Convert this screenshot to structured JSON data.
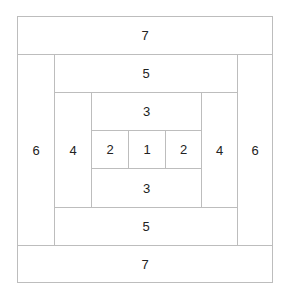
{
  "diagram": {
    "line_color": "#bdbdbd",
    "text_color": "#222222",
    "pieces": [
      {
        "id": "top-7",
        "label": "7",
        "x": 17,
        "y": 16,
        "w": 256,
        "h": 39
      },
      {
        "id": "left-6",
        "label": "6",
        "x": 17,
        "y": 54,
        "w": 38,
        "h": 192
      },
      {
        "id": "right-6",
        "label": "6",
        "x": 237,
        "y": 54,
        "w": 36,
        "h": 192
      },
      {
        "id": "bottom-7",
        "label": "7",
        "x": 17,
        "y": 245,
        "w": 256,
        "h": 38
      },
      {
        "id": "top-5",
        "label": "5",
        "x": 54,
        "y": 54,
        "w": 184,
        "h": 39
      },
      {
        "id": "bottom-5",
        "label": "5",
        "x": 54,
        "y": 207,
        "w": 184,
        "h": 39
      },
      {
        "id": "left-4",
        "label": "4",
        "x": 54,
        "y": 92,
        "w": 38,
        "h": 116
      },
      {
        "id": "right-4",
        "label": "4",
        "x": 201,
        "y": 92,
        "w": 37,
        "h": 116
      },
      {
        "id": "top-3",
        "label": "3",
        "x": 91,
        "y": 92,
        "w": 111,
        "h": 39
      },
      {
        "id": "bottom-3",
        "label": "3",
        "x": 91,
        "y": 168,
        "w": 111,
        "h": 40
      },
      {
        "id": "left-2",
        "label": "2",
        "x": 91,
        "y": 130,
        "w": 38,
        "h": 39
      },
      {
        "id": "center-1",
        "label": "1",
        "x": 128,
        "y": 130,
        "w": 38,
        "h": 39
      },
      {
        "id": "right-2",
        "label": "2",
        "x": 165,
        "y": 130,
        "w": 37,
        "h": 39
      }
    ]
  }
}
